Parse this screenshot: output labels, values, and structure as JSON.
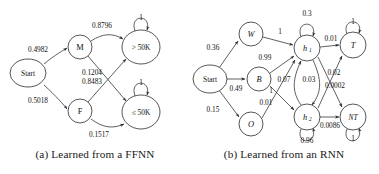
{
  "figure": {
    "panels": [
      {
        "id": "ffnn",
        "caption": "(a) Learned from a FFNN",
        "nodes": [
          {
            "id": "start",
            "label": "Start",
            "x": 28,
            "y": 73,
            "rx": 18,
            "ry": 14,
            "style": "plain"
          },
          {
            "id": "m",
            "label": "M",
            "x": 80,
            "y": 47,
            "rx": 12,
            "ry": 12,
            "style": "plain"
          },
          {
            "id": "f",
            "label": "F",
            "x": 80,
            "y": 111,
            "rx": 12,
            "ry": 12,
            "style": "plain"
          },
          {
            "id": "gt50k",
            "label": "> 50K",
            "x": 141,
            "y": 47,
            "rx": 19,
            "ry": 17,
            "style": "small"
          },
          {
            "id": "le50k",
            "label": "≤ 50K",
            "x": 141,
            "y": 112,
            "rx": 19,
            "ry": 17,
            "style": "small"
          }
        ],
        "edges": [
          {
            "from": "start",
            "to": "m",
            "label": "0.4982"
          },
          {
            "from": "start",
            "to": "f",
            "label": "0.5018"
          },
          {
            "from": "m",
            "to": "gt50k",
            "label": "0.8796"
          },
          {
            "from": "m",
            "to": "le50k",
            "label": "0.1204"
          },
          {
            "from": "f",
            "to": "gt50k",
            "label": "0.8483"
          },
          {
            "from": "f",
            "to": "le50k",
            "label": "0.1517"
          },
          {
            "from": "gt50k",
            "to": "gt50k",
            "label": "1",
            "kind": "self-loop"
          },
          {
            "from": "le50k",
            "to": "le50k",
            "label": "1",
            "kind": "self-loop"
          }
        ]
      },
      {
        "id": "rnn",
        "caption": "(b) Learned from an RNN",
        "nodes": [
          {
            "id": "start",
            "label": "Start",
            "x": 21,
            "y": 79,
            "rx": 17,
            "ry": 14,
            "style": "plain"
          },
          {
            "id": "w",
            "label": "W",
            "x": 62,
            "y": 34,
            "rx": 12,
            "ry": 12,
            "style": "italic"
          },
          {
            "id": "b",
            "label": "B",
            "x": 70,
            "y": 79,
            "rx": 12,
            "ry": 12,
            "style": "italic"
          },
          {
            "id": "o",
            "label": "O",
            "x": 62,
            "y": 124,
            "rx": 12,
            "ry": 12,
            "style": "italic"
          },
          {
            "id": "h1",
            "label": "h",
            "sub": "1",
            "x": 118,
            "y": 48,
            "rx": 13,
            "ry": 13,
            "style": "italic-sub"
          },
          {
            "id": "h2",
            "label": "h",
            "sub": "2",
            "x": 118,
            "y": 117,
            "rx": 13,
            "ry": 13,
            "style": "italic-sub"
          },
          {
            "id": "t",
            "label": "T",
            "x": 164,
            "y": 45,
            "rx": 13,
            "ry": 13,
            "style": "italic"
          },
          {
            "id": "nt",
            "label": "NT",
            "x": 164,
            "y": 117,
            "rx": 13,
            "ry": 13,
            "style": "italic"
          }
        ],
        "edges": [
          {
            "from": "start",
            "to": "w",
            "label": "0.36"
          },
          {
            "from": "start",
            "to": "b",
            "label": "0.49"
          },
          {
            "from": "start",
            "to": "o",
            "label": "0.15"
          },
          {
            "from": "w",
            "to": "h1",
            "label": "1"
          },
          {
            "from": "b",
            "to": "h1",
            "label": "0.99"
          },
          {
            "from": "b",
            "to": "h2",
            "label": "0.01"
          },
          {
            "from": "o",
            "to": "h1",
            "label": "1"
          },
          {
            "from": "h1",
            "to": "h1",
            "label": "0.3",
            "kind": "self-loop"
          },
          {
            "from": "h1",
            "to": "h2",
            "label": "0.03"
          },
          {
            "from": "h2",
            "to": "h1",
            "label": "0.07"
          },
          {
            "from": "h2",
            "to": "h2",
            "label": "0.96",
            "kind": "self-loop"
          },
          {
            "from": "h1",
            "to": "t",
            "label": "0.01"
          },
          {
            "from": "h1",
            "to": "nt",
            "label": "0.0002"
          },
          {
            "from": "h2",
            "to": "t",
            "label": "0.02"
          },
          {
            "from": "h2",
            "to": "nt",
            "label": "0.0086"
          },
          {
            "from": "t",
            "to": "t",
            "label": "1",
            "kind": "self-loop"
          },
          {
            "from": "nt",
            "to": "nt",
            "label": "1",
            "kind": "self-loop"
          }
        ]
      }
    ]
  },
  "colors": {
    "stroke": "#2b2b2b",
    "text": "#111111",
    "background": "#ffffff"
  }
}
